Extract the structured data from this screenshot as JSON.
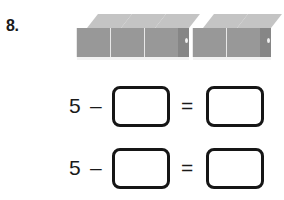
{
  "worksheet": {
    "problem_number": "8.",
    "manipulatives": {
      "icon": "unit-cube",
      "total_cubes": 5,
      "groups": [
        {
          "label": "group-1",
          "count": 3
        },
        {
          "label": "group-2",
          "count": 2
        }
      ]
    },
    "equations": [
      {
        "id": "equation-1",
        "minuend": "5",
        "minus_sign": "–",
        "subtrahend_value": "",
        "equals_sign": "=",
        "difference_value": "",
        "blank_placeholder": ""
      },
      {
        "id": "equation-2",
        "minuend": "5",
        "minus_sign": "–",
        "subtrahend_value": "",
        "equals_sign": "=",
        "difference_value": "",
        "blank_placeholder": ""
      }
    ],
    "colors": {
      "background": "#ffffff",
      "ink": "#161616",
      "cube_top": "#c4c4c4",
      "cube_front": "#989898",
      "cube_side": "#868686"
    }
  }
}
